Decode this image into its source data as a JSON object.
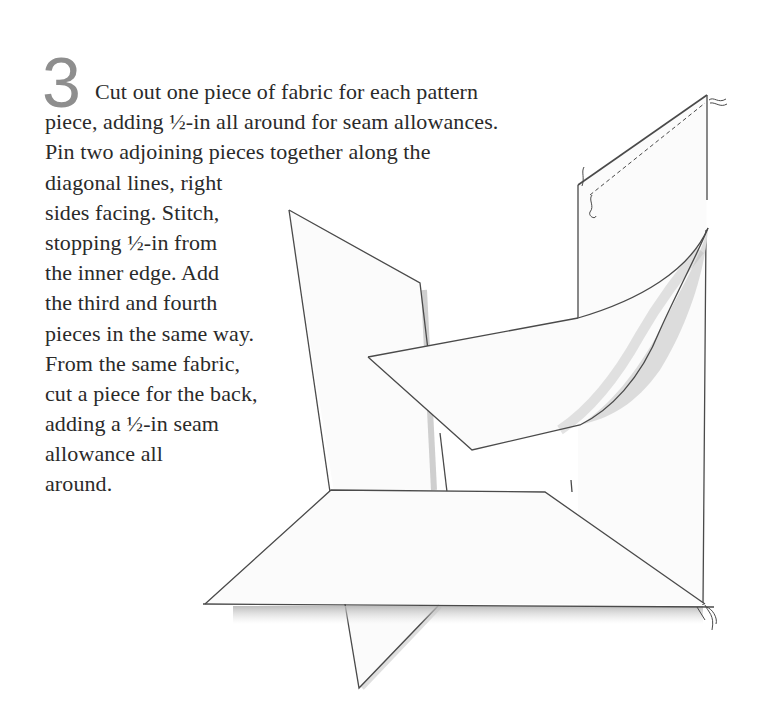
{
  "step": {
    "number": "3",
    "lines": [
      "Cut out one piece of fabric for each pattern",
      "piece, adding ½-in all around for seam allowances.",
      "Pin two adjoining pieces together along the",
      "diagonal lines, right",
      "sides facing. Stitch,",
      "stopping ½-in from",
      "the inner edge. Add",
      "the third and fourth",
      "pieces in the same way.",
      "From the same fabric,",
      "cut a piece for the back,",
      "adding a ½-in seam",
      "allowance all",
      "around."
    ]
  },
  "illustration": {
    "subject": "fabric-pieces-being-stitched",
    "colors": {
      "outline": "#4a4a4a",
      "fabric": "#fbfbfb",
      "shadow": "#bdbdbd",
      "numeral": "#8e8e8e"
    }
  }
}
